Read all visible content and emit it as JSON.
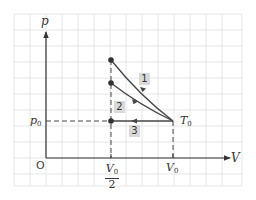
{
  "diagram": {
    "axes": {
      "y_label": "p",
      "x_label": "V",
      "origin_label": "O"
    },
    "ticks": {
      "x": [
        {
          "label_main": "V",
          "label_sub": "0",
          "denominator": "2",
          "meaning": "V0/2"
        },
        {
          "label_main": "V",
          "label_sub": "0",
          "meaning": "V0"
        }
      ],
      "y": [
        {
          "label_main": "p",
          "label_sub": "0",
          "meaning": "p0"
        }
      ]
    },
    "state_label": {
      "main": "T",
      "sub": "0"
    },
    "process_tags": [
      "1",
      "2",
      "3"
    ],
    "colors": {
      "grid": "#e4e4e4",
      "axis": "#333333",
      "curve": "#444444",
      "tag_bg": "#d9d9d9",
      "dashed": "#444444"
    }
  }
}
